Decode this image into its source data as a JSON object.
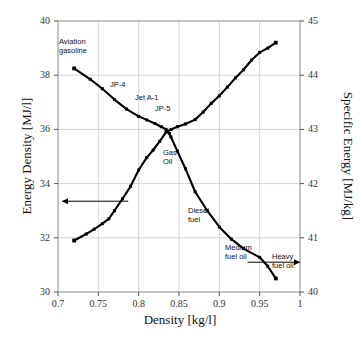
{
  "chart_data": {
    "type": "line",
    "title": "",
    "xlabel": "Density [kg/l]",
    "ylabel": "Energy Density [MJ/l]",
    "y2label": "Specific Energy [MJ/kg]",
    "xlim": [
      0.7,
      1.0
    ],
    "ylim": [
      30,
      40
    ],
    "y2lim": [
      40,
      45
    ],
    "xticks": [
      "0.7",
      "0.75",
      "0.8",
      "0.85",
      "0.9",
      "0.95",
      "1"
    ],
    "yticks": [
      "30",
      "32",
      "34",
      "36",
      "38",
      "40"
    ],
    "y2ticks": [
      "40",
      "41",
      "42",
      "43",
      "44",
      "45"
    ],
    "grid": true,
    "legend": "none",
    "series": [
      {
        "name": "Energy Density [MJ/l]",
        "axis": "left",
        "color": "#000000",
        "marker": "square",
        "x": [
          0.72,
          0.74,
          0.755,
          0.77,
          0.785,
          0.8,
          0.81,
          0.82,
          0.828,
          0.834,
          0.838,
          0.84,
          0.848,
          0.858,
          0.87,
          0.885,
          0.9,
          0.915,
          0.93,
          0.95,
          0.96,
          0.97
        ],
        "y": [
          38.25,
          37.85,
          37.5,
          37.1,
          36.75,
          36.48,
          36.35,
          36.22,
          36.1,
          36.0,
          35.85,
          35.72,
          35.2,
          34.55,
          33.7,
          33.0,
          32.4,
          31.95,
          31.6,
          31.28,
          30.95,
          30.5
        ]
      },
      {
        "name": "Specific Energy [MJ/kg]",
        "axis": "right",
        "color": "#000000",
        "marker": "square",
        "x": [
          0.72,
          0.735,
          0.745,
          0.755,
          0.763,
          0.77,
          0.78,
          0.79,
          0.8,
          0.81,
          0.818,
          0.826,
          0.834,
          0.84,
          0.848,
          0.858,
          0.87,
          0.88,
          0.89,
          0.9,
          0.91,
          0.92,
          0.93,
          0.94,
          0.95,
          0.96,
          0.97
        ],
        "y": [
          40.95,
          41.07,
          41.16,
          41.26,
          41.35,
          41.5,
          41.72,
          41.95,
          42.25,
          42.48,
          42.62,
          42.78,
          42.95,
          43.0,
          43.05,
          43.1,
          43.18,
          43.32,
          43.48,
          43.62,
          43.78,
          43.95,
          44.1,
          44.28,
          44.42,
          44.5,
          44.6
        ]
      }
    ],
    "annotations": [
      {
        "name": "aviation-gasoline",
        "text": "Aviation\ngasoline",
        "x": 0.726,
        "y": 38.9,
        "px": 59,
        "py": 37
      },
      {
        "name": "jp-4",
        "text": "JP-4",
        "x": 0.772,
        "y": 37.55,
        "px": 110,
        "py": 80
      },
      {
        "name": "jet-a-1",
        "text": "Jet A-1",
        "x": 0.8,
        "y": 36.95,
        "px": 135,
        "py": 93
      },
      {
        "name": "jp-5",
        "text": "JP-5",
        "x": 0.827,
        "y": 36.55,
        "px": 155,
        "py": 104
      },
      {
        "name": "gas-oil",
        "text": "Gas\nOil",
        "x": 0.845,
        "y": 35.1,
        "px": 163,
        "py": 148
      },
      {
        "name": "diesel-fuel",
        "text": "Diesel\nfuel",
        "x": 0.875,
        "y": 32.55,
        "px": 188,
        "py": 206
      },
      {
        "name": "medium-fuel-oil",
        "text": "Medium\nfuel oil",
        "x": 0.93,
        "y": 31.25,
        "px": 225,
        "py": 243
      },
      {
        "name": "heavy-fuel-oil",
        "text": "Heavy\nfuel oil",
        "x": 0.968,
        "y": 30.95,
        "px": 272,
        "py": 252
      }
    ],
    "arrows": [
      {
        "name": "left-axis-arrow",
        "direction": "left",
        "x_start": 0.787,
        "x_end": 0.705,
        "y": 33.35
      },
      {
        "name": "right-axis-arrow",
        "direction": "right",
        "x_start": 0.935,
        "x_end": 1.0,
        "y": 31.1
      }
    ]
  }
}
